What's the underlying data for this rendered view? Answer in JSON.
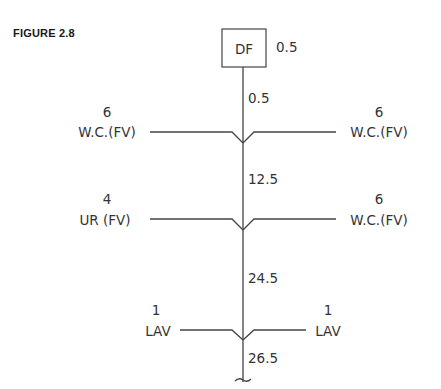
{
  "figure": {
    "label": "FIGURE 2.8"
  },
  "top_fixture": {
    "name": "DF",
    "value": "0.5"
  },
  "stack_segments": [
    "0.5",
    "12.5",
    "24.5",
    "26.5"
  ],
  "branches": [
    {
      "left": {
        "count": "6",
        "name": "W.C.(FV)"
      },
      "right": {
        "count": "6",
        "name": "W.C.(FV)"
      }
    },
    {
      "left": {
        "count": "4",
        "name": "UR (FV)"
      },
      "right": {
        "count": "6",
        "name": "W.C.(FV)"
      }
    },
    {
      "left": {
        "count": "1",
        "name": "LAV"
      },
      "right": {
        "count": "1",
        "name": "LAV"
      }
    }
  ],
  "colors": {
    "line": "#444444",
    "text": "#333333",
    "figure_label": "#1a1a1a"
  }
}
